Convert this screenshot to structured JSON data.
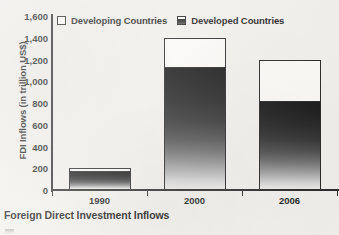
{
  "caption": "Foreign Direct Investment Inflows",
  "legend": {
    "items": [
      {
        "label": "Developing Countries",
        "swatch": "white-square-icon"
      },
      {
        "label": "Developed Countries",
        "swatch": "gradient-square-icon"
      }
    ]
  },
  "chart_data": {
    "type": "bar",
    "subtype": "stacked-vertical",
    "title": "Foreign Direct Investment Inflows",
    "xlabel": "",
    "ylabel": "FDI Inflows (in trillion US$)",
    "categories": [
      "1990",
      "2000",
      "2006"
    ],
    "series": [
      {
        "name": "Developed Countries",
        "values": [
          170,
          1120,
          810
        ]
      },
      {
        "name": "Developing Countries",
        "values": [
          30,
          280,
          390
        ]
      }
    ],
    "totals": [
      200,
      1400,
      1200
    ],
    "ylim": [
      0,
      1600
    ],
    "ytick_labels": [
      "0",
      "200",
      "400",
      "600",
      "800",
      "1,000",
      "1,200",
      "1,400",
      "1,600"
    ],
    "ytick_values": [
      0,
      200,
      400,
      600,
      800,
      1000,
      1200,
      1400,
      1600
    ],
    "grid": false,
    "legend_position": "top-inside"
  }
}
